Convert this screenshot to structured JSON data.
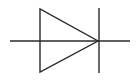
{
  "diagram": {
    "type": "circuit-symbol",
    "symbol": "diode",
    "stroke_color": "#2a2a2a",
    "background": "#ffffff",
    "elements": {
      "lead_line": {
        "x1": 10,
        "y1": 41,
        "x2": 130,
        "y2": 41
      },
      "triangle_anode": {
        "points": "40,9 40,72 98,41"
      },
      "cathode_bar": {
        "x1": 99,
        "y1": 8,
        "x2": 99,
        "y2": 73
      }
    }
  }
}
